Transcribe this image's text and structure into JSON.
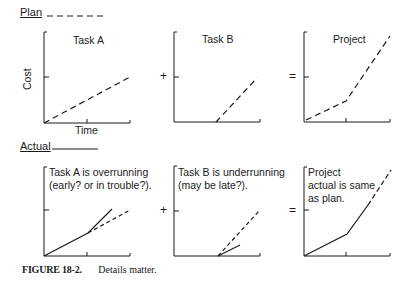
{
  "legend": {
    "plan_label": "Plan",
    "plan_style": "dashed",
    "actual_label": "Actual",
    "actual_style": "solid"
  },
  "top_row": {
    "panels": [
      {
        "title": "Task A",
        "ylabel": "Cost",
        "xlabel": "Time"
      },
      {
        "title": "Task B"
      },
      {
        "title": "Project"
      }
    ],
    "operators": [
      "+",
      "="
    ]
  },
  "bottom_row": {
    "panels": [
      {
        "note": "Task A is overrunning\n(early? or in trouble?)."
      },
      {
        "note": "Task B is underrunning\n(may be late?)."
      },
      {
        "note": "Project\nactual is same\nas plan."
      }
    ],
    "operators": [
      "+",
      "="
    ]
  },
  "caption": {
    "number": "FIGURE 18-2.",
    "text": "Details matter."
  },
  "colors": {
    "ink": "#1a1a1a",
    "background": "#ffffff"
  }
}
